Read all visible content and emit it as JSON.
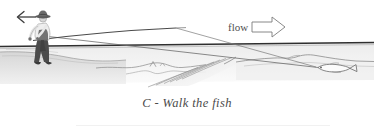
{
  "figure": {
    "caption": "C - Walk the fish",
    "caption_letter": "C",
    "caption_dash": "-",
    "caption_text": "Walk the fish",
    "flow_label": "flow",
    "flow_arrow_direction": "right",
    "angler_move_arrow_direction": "left",
    "elements": {
      "angler": "wading fly angler with hat, light shirt, dark waders, holding rod",
      "fish": "hooked fish on end of line near riverbed drop-off",
      "waterline": "dark horizontal water surface line",
      "riverbed": "contoured streambed with stepped drop-off and hatching",
      "fishing_line": "line from rod tip down-right to fish",
      "rod": "fly rod angled to the right"
    },
    "colors": {
      "background": "#ffffff",
      "ink": "#3b3b3b",
      "line": "#6f6f6f",
      "water": "#f2f2f2",
      "bank": "#d9d9d9",
      "waders": "#4a4a4a",
      "shirt": "#efefef",
      "caption_text": "#4a4a4a",
      "rule": "#f0f0f0"
    }
  }
}
